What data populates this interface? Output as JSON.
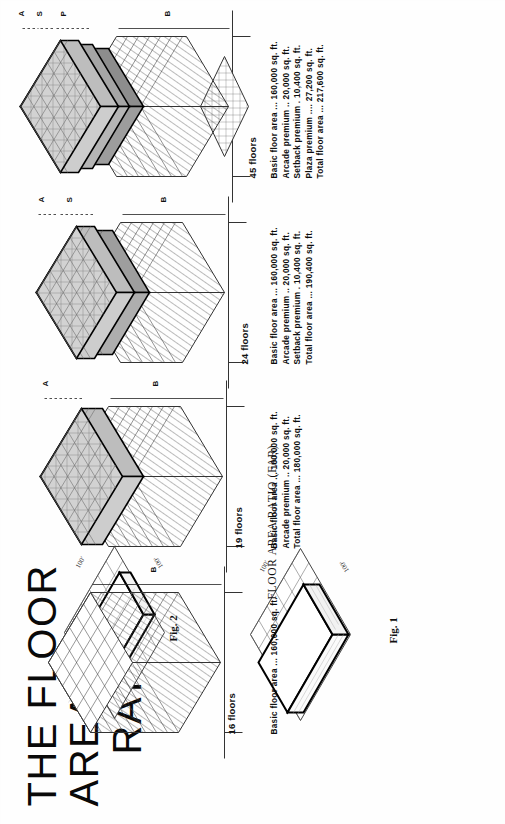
{
  "page": {
    "title_line1": "THE FLOOR AREA",
    "title_line2": "RATIO",
    "far_caption": "FLOOR AREA RATIO (FAR)"
  },
  "figures": [
    {
      "id": "fig1",
      "caption": "Fig. 1",
      "lot_dim_a": "100'",
      "lot_dim_b": "100'",
      "description": "tall single block on lot grid"
    },
    {
      "id": "fig2",
      "caption": "Fig. 2",
      "lot_dim_a": "100'",
      "lot_dim_b": "100'",
      "description": "flat wide slab on lot grid"
    }
  ],
  "buildings": [
    {
      "id": "b16",
      "floors_label": "16 floors",
      "zones": [
        "B"
      ],
      "spec": [
        {
          "label": "Basic floor area",
          "dots": "...",
          "value": "160,000 sq. ft."
        }
      ]
    },
    {
      "id": "b19",
      "floors_label": "19 floors",
      "zones": [
        "B",
        "A"
      ],
      "spec": [
        {
          "label": "Basic floor area",
          "dots": "...",
          "value": "160,000 sq. ft."
        },
        {
          "label": "Arcade premium",
          "dots": "..",
          "value": "20,000 sq. ft."
        },
        {
          "label": "Total floor area",
          "dots": "...",
          "value": "180,000 sq. ft."
        }
      ]
    },
    {
      "id": "b24",
      "floors_label": "24 floors",
      "zones": [
        "B",
        "S",
        "A"
      ],
      "spec": [
        {
          "label": "Basic floor area",
          "dots": "...",
          "value": "160,000 sq. ft."
        },
        {
          "label": "Arcade premium",
          "dots": "..",
          "value": "20,000 sq. ft."
        },
        {
          "label": "Setback premium",
          "dots": ".",
          "value": "10,400 sq. ft."
        },
        {
          "label": "Total floor area",
          "dots": "...",
          "value": "190,400 sq. ft."
        }
      ]
    },
    {
      "id": "b45",
      "floors_label": "45 floors",
      "zones": [
        "B",
        "P",
        "S",
        "A"
      ],
      "spec": [
        {
          "label": "Basic floor area",
          "dots": "...",
          "value": "160,000 sq. ft."
        },
        {
          "label": "Arcade premium",
          "dots": "..",
          "value": "20,000 sq. ft."
        },
        {
          "label": "Setback premium",
          "dots": ".",
          "value": "10,400 sq. ft."
        },
        {
          "label": "Plaza premium",
          "dots": "....",
          "value": "27,200 sq. ft."
        },
        {
          "label": "Total floor area",
          "dots": "...",
          "value": "217,600 sq. ft."
        }
      ]
    }
  ],
  "colors": {
    "ink": "#111111",
    "paper": "#fefefe",
    "shade_light": "#d8d8d8",
    "shade_mid": "#b9b9b9",
    "shade_dark": "#9a9a9a",
    "hatch": "#4a4a4a"
  }
}
